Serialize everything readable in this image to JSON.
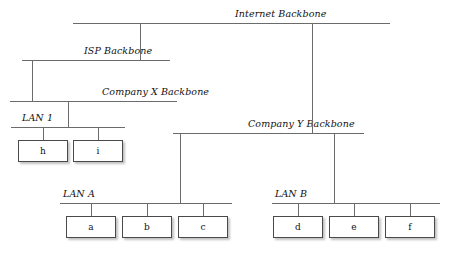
{
  "diagram": {
    "line_color": "#6b6b6b",
    "node_border_color": "#4a4a4a",
    "node_fill_color": "#ffffff",
    "text_color": "#111111",
    "buses": [
      {
        "id": "internet-backbone",
        "label": "Internet Backbone",
        "x1": 73,
        "x2": 390,
        "y": 23,
        "label_x": 235,
        "label_y": 8
      },
      {
        "id": "isp-backbone",
        "label": "ISP Backbone",
        "x1": 22,
        "x2": 170,
        "y": 60,
        "label_x": 84,
        "label_y": 45
      },
      {
        "id": "company-x-backbone",
        "label": "Company X Backbone",
        "x1": 10,
        "x2": 177,
        "y": 101,
        "label_x": 102,
        "label_y": 86
      },
      {
        "id": "company-y-backbone",
        "label": "Company Y Backbone",
        "x1": 173,
        "x2": 364,
        "y": 133,
        "label_x": 248,
        "label_y": 118
      },
      {
        "id": "lan-1",
        "label": "LAN 1",
        "x1": 11,
        "x2": 125,
        "y": 127,
        "label_x": 22,
        "label_y": 112
      },
      {
        "id": "lan-a",
        "label": "LAN A",
        "x1": 60,
        "x2": 232,
        "y": 203,
        "label_x": 63,
        "label_y": 188
      },
      {
        "id": "lan-b",
        "label": "LAN B",
        "x1": 272,
        "x2": 440,
        "y": 203,
        "label_x": 275,
        "label_y": 188
      }
    ],
    "connectors": [
      {
        "id": "internet-to-isp",
        "x": 140,
        "y1": 23,
        "y2": 60
      },
      {
        "id": "internet-to-company-y",
        "x": 312,
        "y1": 23,
        "y2": 133
      },
      {
        "id": "isp-to-company-x",
        "x": 32,
        "y1": 60,
        "y2": 101
      },
      {
        "id": "company-x-to-lan-1",
        "x": 68,
        "y1": 101,
        "y2": 127
      },
      {
        "id": "company-y-to-lan-a",
        "x": 180,
        "y1": 133,
        "y2": 203
      },
      {
        "id": "company-y-to-lan-b",
        "x": 334,
        "y1": 133,
        "y2": 203
      },
      {
        "id": "lan-1-to-h",
        "x": 43,
        "y1": 127,
        "y2": 140
      },
      {
        "id": "lan-1-to-i",
        "x": 98,
        "y1": 127,
        "y2": 140
      },
      {
        "id": "lan-a-to-a",
        "x": 91,
        "y1": 203,
        "y2": 216
      },
      {
        "id": "lan-a-to-b",
        "x": 147,
        "y1": 203,
        "y2": 216
      },
      {
        "id": "lan-a-to-c",
        "x": 203,
        "y1": 203,
        "y2": 216
      },
      {
        "id": "lan-b-to-d",
        "x": 298,
        "y1": 203,
        "y2": 216
      },
      {
        "id": "lan-b-to-e",
        "x": 354,
        "y1": 203,
        "y2": 216
      },
      {
        "id": "lan-b-to-f",
        "x": 410,
        "y1": 203,
        "y2": 216
      }
    ],
    "nodes": [
      {
        "id": "node-h",
        "label": "h",
        "x": 18,
        "y": 140,
        "parent": "lan-1"
      },
      {
        "id": "node-i",
        "label": "i",
        "x": 73,
        "y": 140,
        "parent": "lan-1"
      },
      {
        "id": "node-a",
        "label": "a",
        "x": 66,
        "y": 216,
        "parent": "lan-a"
      },
      {
        "id": "node-b",
        "label": "b",
        "x": 122,
        "y": 216,
        "parent": "lan-a"
      },
      {
        "id": "node-c",
        "label": "c",
        "x": 178,
        "y": 216,
        "parent": "lan-a"
      },
      {
        "id": "node-d",
        "label": "d",
        "x": 273,
        "y": 216,
        "parent": "lan-b"
      },
      {
        "id": "node-e",
        "label": "e",
        "x": 329,
        "y": 216,
        "parent": "lan-b"
      },
      {
        "id": "node-f",
        "label": "f",
        "x": 385,
        "y": 216,
        "parent": "lan-b"
      }
    ]
  }
}
